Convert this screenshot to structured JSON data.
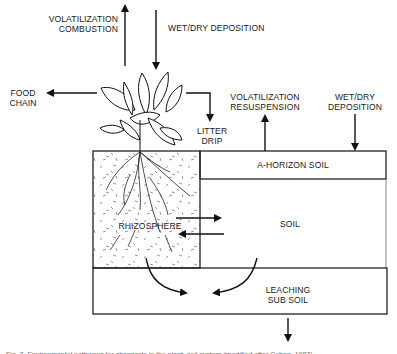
{
  "diagram": {
    "type": "environmental-pathway-diagram",
    "labels": {
      "volatilization_combustion": [
        "VOLATILIZATION",
        "COMBUSTION"
      ],
      "wet_dry_deposition_top": "WET/DRY DEPOSITION",
      "food_chain": [
        "FOOD",
        "CHAIN"
      ],
      "litter_drip": [
        "LITTER",
        "DRIP"
      ],
      "volatilization_resuspension": [
        "VOLATILIZATION",
        "RESUSPENSION"
      ],
      "wet_dry_deposition_right": [
        "WET/DRY",
        "DEPOSITION"
      ],
      "a_horizon_soil": "A-HORIZON SOIL",
      "rhizosphere": "RHIZOSPHERE",
      "soil": "SOIL",
      "leaching_sub_soil": [
        "LEACHING",
        "SUB SOIL"
      ]
    },
    "nodes": [
      {
        "id": "plant",
        "label": "Plant"
      },
      {
        "id": "rhizosphere",
        "label": "RHIZOSPHERE"
      },
      {
        "id": "a_horizon",
        "label": "A-HORIZON SOIL"
      },
      {
        "id": "soil",
        "label": "SOIL"
      },
      {
        "id": "sub_soil",
        "label": "SUB SOIL"
      }
    ],
    "edges": [
      {
        "from": "plant",
        "to": "atmosphere",
        "label": "VOLATILIZATION COMBUSTION"
      },
      {
        "from": "atmosphere",
        "to": "plant",
        "label": "WET/DRY DEPOSITION"
      },
      {
        "from": "plant",
        "to": "food_chain",
        "label": "FOOD CHAIN"
      },
      {
        "from": "plant",
        "to": "a_horizon",
        "label": "LITTER DRIP"
      },
      {
        "from": "a_horizon",
        "to": "atmosphere",
        "label": "VOLATILIZATION RESUSPENSION"
      },
      {
        "from": "atmosphere",
        "to": "a_horizon",
        "label": "WET/DRY DEPOSITION"
      },
      {
        "from": "rhizosphere",
        "to": "soil",
        "label": ""
      },
      {
        "from": "soil",
        "to": "rhizosphere",
        "label": ""
      },
      {
        "from": "rhizosphere",
        "to": "sub_soil",
        "label": ""
      },
      {
        "from": "soil",
        "to": "sub_soil",
        "label": ""
      },
      {
        "from": "sub_soil",
        "to": "below",
        "label": "LEACHING"
      }
    ]
  },
  "caption": "Fig. 7. Environmental pathways for chemicals in the plant–soil system (modified after Cohen, 1987)."
}
